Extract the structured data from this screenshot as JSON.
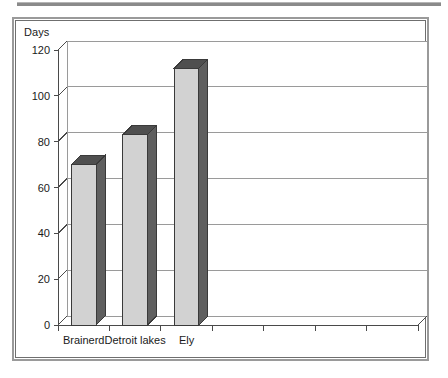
{
  "chart_data": {
    "type": "bar",
    "title": "",
    "subtitle": "",
    "xlabel": "",
    "ylabel": "Days",
    "categories": [
      "Brainerd",
      "Detroit lakes",
      "Ely"
    ],
    "values": [
      70,
      83,
      112
    ],
    "series": [
      {
        "name": "Days",
        "values": [
          70,
          83,
          112
        ]
      }
    ],
    "ylim": [
      0,
      120
    ],
    "yticks": [
      0,
      20,
      40,
      60,
      80,
      100,
      120
    ],
    "ytick_labels": [
      "0",
      "20",
      "40",
      "60",
      "80",
      "100",
      "120"
    ],
    "grid": true,
    "grid_axis": "y",
    "legend": false,
    "legend_position": "none",
    "style": "3d-column",
    "empty_category_slots": 4,
    "colors": {
      "bar_front": "#d2d2d2",
      "bar_side": "#5f5f5f",
      "bar_top": "#4f4f4f",
      "bar_outline": "#3a3a3a",
      "gridline": "#9a9a9a",
      "axis": "#4a4a4a",
      "plot_background": "#ffffff",
      "frame_outer": "#9a9a9a",
      "frame_inner": "#6f6f6f",
      "text": "#1a1a1a",
      "top_rule": "#8a8a8a"
    }
  },
  "chart": {
    "axis_title": "Days",
    "y_axis": {
      "ticks": [
        "120",
        "100",
        "80",
        "60",
        "40",
        "20",
        "0"
      ]
    },
    "x_axis": {
      "labels": [
        "Brainerd",
        "Detroit lakes",
        "Ely"
      ]
    }
  }
}
